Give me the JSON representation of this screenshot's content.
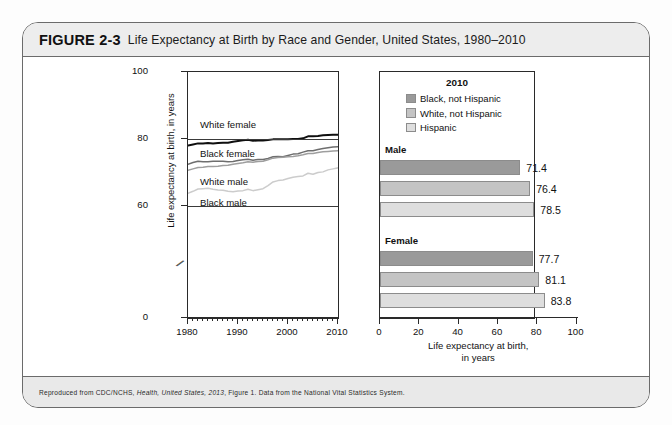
{
  "figure": {
    "number": "FIGURE 2-3",
    "title": "Life Expectancy at Birth by Race and Gender, United States, 1980–2010",
    "credit_prefix": "Reproduced from CDC/NCHS, ",
    "credit_italic": "Health, United States, 2013",
    "credit_suffix": ", Figure 1. Data from the National Vital Statistics System."
  },
  "colors": {
    "frame": "#6b6b6b",
    "header_bg": "#ededed",
    "footer_bg": "#e9e9e9",
    "axis": "#2a2a2a",
    "black_not_hispanic": "#9a9a9a",
    "white_not_hispanic": "#c4c4c4",
    "hispanic": "#dedede",
    "line_white_female": "#0f0f0f",
    "line_black_female": "#6e6e6e",
    "line_white_male": "#9e9e9e",
    "line_black_male": "#cccccc"
  },
  "chart_data": [
    {
      "type": "line",
      "title": "",
      "xlabel": "",
      "ylabel": "Life expectancy at birth, in years",
      "xlim": [
        1980,
        2010
      ],
      "ylim": [
        58,
        100
      ],
      "ytick_labels": [
        "100",
        "80",
        "60",
        "0"
      ],
      "ytick_values": [
        100,
        80,
        60,
        0
      ],
      "axis_break": true,
      "grid": false,
      "xtick_labels": [
        "1980",
        "1990",
        "2000",
        "2010"
      ],
      "xtick_values": [
        1980,
        1990,
        2000,
        2010
      ],
      "x": [
        1980,
        1981,
        1982,
        1983,
        1984,
        1985,
        1986,
        1987,
        1988,
        1989,
        1990,
        1991,
        1992,
        1993,
        1994,
        1995,
        1996,
        1997,
        1998,
        1999,
        2000,
        2001,
        2002,
        2003,
        2004,
        2005,
        2006,
        2007,
        2008,
        2009,
        2010
      ],
      "series": [
        {
          "name": "White female",
          "label": "White female",
          "color": "#0f0f0f",
          "values": [
            78.1,
            78.4,
            78.7,
            78.7,
            78.8,
            78.7,
            78.8,
            78.9,
            78.9,
            79.2,
            79.4,
            79.6,
            79.8,
            79.5,
            79.6,
            79.6,
            79.7,
            79.9,
            79.9,
            79.9,
            79.9,
            80.0,
            80.0,
            80.2,
            80.8,
            80.8,
            80.9,
            81.1,
            81.2,
            81.3,
            81.3
          ]
        },
        {
          "name": "Black female",
          "label": "Black female",
          "color": "#6e6e6e",
          "values": [
            72.5,
            73.0,
            73.4,
            73.2,
            73.2,
            73.4,
            73.4,
            73.4,
            73.2,
            73.3,
            73.6,
            73.8,
            74.0,
            73.7,
            73.9,
            73.9,
            74.2,
            74.7,
            74.8,
            74.7,
            75.1,
            75.5,
            75.6,
            76.1,
            76.5,
            76.5,
            76.9,
            77.2,
            77.4,
            77.6,
            77.7
          ]
        },
        {
          "name": "White male",
          "label": "White male",
          "color": "#9e9e9e",
          "values": [
            70.7,
            71.1,
            71.5,
            71.6,
            71.8,
            71.8,
            71.9,
            72.1,
            72.2,
            72.5,
            72.7,
            72.9,
            73.2,
            73.1,
            73.3,
            73.4,
            73.8,
            74.3,
            74.5,
            74.6,
            74.7,
            74.8,
            75.0,
            75.3,
            75.7,
            75.7,
            76.0,
            76.2,
            76.3,
            76.4,
            76.5
          ]
        },
        {
          "name": "Black male",
          "label": "Black male",
          "color": "#cccccc",
          "values": [
            63.8,
            64.4,
            65.1,
            65.2,
            65.3,
            65.0,
            64.8,
            64.7,
            64.4,
            64.3,
            64.5,
            64.6,
            65.0,
            64.6,
            64.9,
            65.2,
            66.1,
            67.2,
            67.6,
            67.8,
            68.2,
            68.6,
            68.8,
            69.0,
            69.8,
            69.5,
            70.0,
            70.2,
            70.8,
            71.1,
            71.4
          ]
        }
      ]
    },
    {
      "type": "bar",
      "orientation": "horizontal",
      "title": "2010",
      "xlabel_line1": "Life expectancy at birth,",
      "xlabel_line2": "in years",
      "ylabel": "",
      "xlim": [
        0,
        100
      ],
      "xtick_labels": [
        "0",
        "20",
        "40",
        "60",
        "80",
        "100"
      ],
      "xtick_values": [
        0,
        20,
        40,
        60,
        80,
        100
      ],
      "legend": [
        {
          "label": "Black, not Hispanic",
          "color": "#9a9a9a"
        },
        {
          "label": "White, not Hispanic",
          "color": "#c4c4c4"
        },
        {
          "label": "Hispanic",
          "color": "#dedede"
        }
      ],
      "groups": [
        {
          "label": "Male",
          "bars": [
            {
              "series": "Black, not Hispanic",
              "value": 71.4,
              "value_label": "71.4",
              "color": "#9a9a9a"
            },
            {
              "series": "White, not Hispanic",
              "value": 76.4,
              "value_label": "76.4",
              "color": "#c4c4c4"
            },
            {
              "series": "Hispanic",
              "value": 78.5,
              "value_label": "78.5",
              "color": "#dedede"
            }
          ]
        },
        {
          "label": "Female",
          "bars": [
            {
              "series": "Black, not Hispanic",
              "value": 77.7,
              "value_label": "77.7",
              "color": "#9a9a9a"
            },
            {
              "series": "White, not Hispanic",
              "value": 81.1,
              "value_label": "81.1",
              "color": "#c4c4c4"
            },
            {
              "series": "Hispanic",
              "value": 83.8,
              "value_label": "83.8",
              "color": "#dedede"
            }
          ]
        }
      ]
    }
  ]
}
